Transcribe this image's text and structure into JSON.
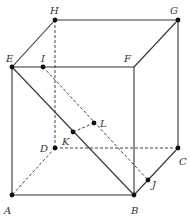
{
  "diagram": {
    "type": "cube",
    "points": {
      "A": {
        "label": "A",
        "x": 12,
        "y": 195,
        "lx": 4,
        "ly": 214
      },
      "B": {
        "label": "B",
        "x": 134,
        "y": 195,
        "lx": 131,
        "ly": 214
      },
      "C": {
        "label": "C",
        "x": 178,
        "y": 148,
        "lx": 179,
        "ly": 165
      },
      "D": {
        "label": "D",
        "x": 55,
        "y": 148,
        "lx": 40,
        "ly": 152
      },
      "E": {
        "label": "E",
        "x": 12,
        "y": 67,
        "lx": 6,
        "ly": 62
      },
      "F": {
        "label": "F",
        "x": 134,
        "y": 67,
        "lx": 124,
        "ly": 62
      },
      "G": {
        "label": "G",
        "x": 178,
        "y": 20,
        "lx": 170,
        "ly": 14
      },
      "H": {
        "label": "H",
        "x": 55,
        "y": 20,
        "lx": 50,
        "ly": 14
      },
      "I": {
        "label": "I",
        "x": 43,
        "y": 67,
        "lx": 41,
        "ly": 62
      },
      "J": {
        "label": "J",
        "x": 148,
        "y": 180,
        "lx": 152,
        "ly": 188
      },
      "K": {
        "label": "K",
        "x": 73,
        "y": 132,
        "lx": 62,
        "ly": 145
      },
      "L": {
        "label": "L",
        "x": 94,
        "y": 123,
        "lx": 100,
        "ly": 127
      }
    },
    "dots": [
      "A",
      "B",
      "C",
      "D",
      "E",
      "G",
      "H",
      "I",
      "J",
      "K",
      "L"
    ],
    "solid_edges": [
      [
        "A",
        "B"
      ],
      [
        "A",
        "E"
      ],
      [
        "E",
        "F"
      ],
      [
        "F",
        "B"
      ],
      [
        "E",
        "H"
      ],
      [
        "H",
        "G"
      ],
      [
        "G",
        "F"
      ],
      [
        "G",
        "C"
      ],
      [
        "C",
        "J"
      ],
      [
        "J",
        "B"
      ],
      [
        "E",
        "B"
      ]
    ],
    "dashed_edges": [
      [
        "H",
        "D"
      ],
      [
        "D",
        "A"
      ],
      [
        "D",
        "C"
      ],
      [
        "I",
        "J"
      ],
      [
        "K",
        "L"
      ]
    ]
  }
}
